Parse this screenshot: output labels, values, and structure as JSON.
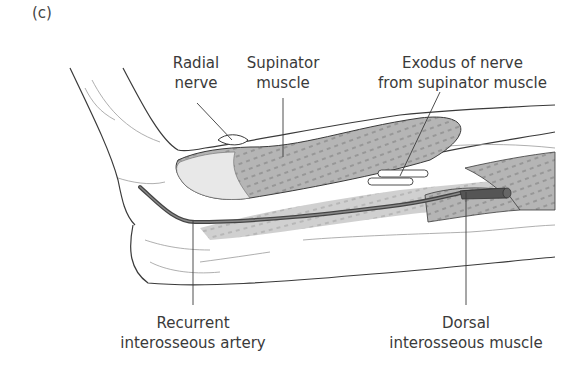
{
  "figure": {
    "panel_label": "(c)",
    "colors": {
      "line": "#3a3a3a",
      "muscle_fill": "#b8b8b8",
      "muscle_light": "#d6d6d6",
      "artery": "#555555",
      "background": "#ffffff"
    }
  },
  "labels": {
    "radial_nerve": {
      "line1": "Radial",
      "line2": "nerve"
    },
    "supinator_muscle": {
      "line1": "Supinator",
      "line2": "muscle"
    },
    "exodus_nerve": {
      "line1": "Exodus of nerve",
      "line2": "from supinator muscle"
    },
    "recurrent_artery": {
      "line1": "Recurrent",
      "line2": "interosseous artery"
    },
    "dorsal_muscle": {
      "line1": "Dorsal",
      "line2": "interosseous muscle"
    }
  }
}
